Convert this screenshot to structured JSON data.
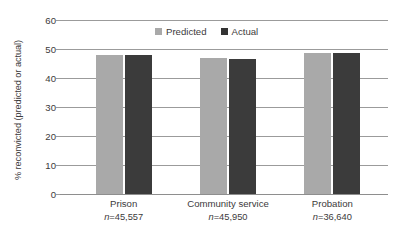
{
  "chart_data": {
    "type": "bar",
    "title": "",
    "subtitle": "",
    "xlabel": "",
    "ylabel": "% reconvicted (predicted or actual)",
    "categories": [
      "Prison",
      "Community service",
      "Probation"
    ],
    "category_sublabels": [
      "n=45,557",
      "n=45,950",
      "n=36,640"
    ],
    "series": [
      {
        "name": "Predicted",
        "color": "#a9a9a9",
        "values": [
          48.0,
          46.8,
          48.6
        ]
      },
      {
        "name": "Actual",
        "color": "#3b3b3b",
        "values": [
          48.0,
          46.6,
          48.7
        ]
      }
    ],
    "ylim": [
      0,
      60
    ],
    "yticks": [
      0,
      10,
      20,
      30,
      40,
      50,
      60
    ],
    "ytick_labels": [
      "0",
      "10",
      "20",
      "30",
      "40",
      "50",
      "60"
    ],
    "grid": "horizontal",
    "legend_position": "top-center"
  },
  "legend": {
    "items": [
      {
        "label": "Predicted",
        "swatch": "predicted-swatch"
      },
      {
        "label": "Actual",
        "swatch": "actual-swatch"
      }
    ]
  },
  "colors": {
    "predicted": "#a9a9a9",
    "actual": "#3b3b3b",
    "gridline": "#9b9b9b",
    "text": "#3c3a3b",
    "background": "#ffffff"
  }
}
